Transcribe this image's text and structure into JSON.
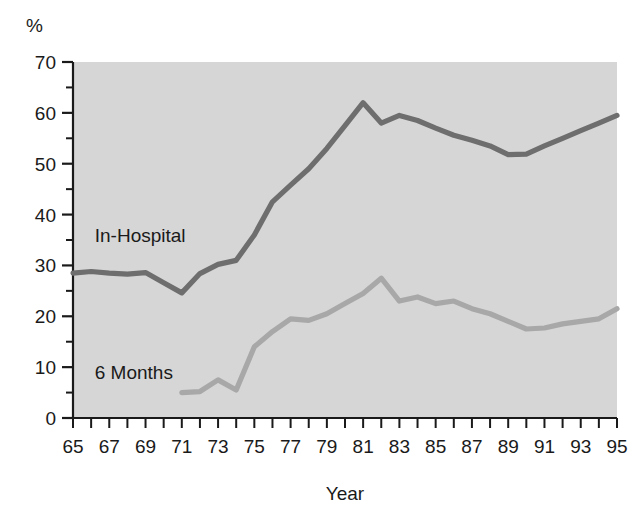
{
  "chart_data": {
    "type": "line",
    "title": "",
    "subtitle": "",
    "xlabel": "Year",
    "ylabel": "%",
    "unit_label": "%",
    "xlim": [
      1965,
      1995
    ],
    "ylim": [
      0,
      70
    ],
    "grid": false,
    "legend_position": "inline-labels",
    "y_major_ticks": [
      0,
      10,
      20,
      30,
      40,
      50,
      60,
      70
    ],
    "y_major_tick_labels": [
      "0",
      "10",
      "20",
      "30",
      "40",
      "50",
      "60",
      "70"
    ],
    "y_minor_ticks": [
      5,
      15,
      25,
      35,
      45,
      55,
      65
    ],
    "x_ticks": [
      1965,
      1966,
      1967,
      1968,
      1969,
      1970,
      1971,
      1972,
      1973,
      1974,
      1975,
      1976,
      1977,
      1978,
      1979,
      1980,
      1981,
      1982,
      1983,
      1984,
      1985,
      1986,
      1987,
      1988,
      1989,
      1990,
      1991,
      1992,
      1993,
      1994,
      1995
    ],
    "x_tick_labels": [
      "65",
      "",
      "67",
      "",
      "69",
      "",
      "71",
      "",
      "73",
      "",
      "75",
      "",
      "77",
      "",
      "79",
      "",
      "81",
      "",
      "83",
      "",
      "85",
      "",
      "87",
      "",
      "89",
      "",
      "91",
      "",
      "93",
      "",
      "95"
    ],
    "x_labeled_values": [
      1965,
      1967,
      1969,
      1971,
      1973,
      1975,
      1977,
      1979,
      1981,
      1983,
      1985,
      1987,
      1989,
      1991,
      1993,
      1995
    ],
    "plot_bg_color": "#d6d6d6",
    "series": [
      {
        "name": "In-Hospital",
        "label": "In-Hospital",
        "color": "#6e6e6e",
        "label_x": 1966.2,
        "label_y": 34.6,
        "x": [
          1965,
          1966,
          1967,
          1968,
          1969,
          1970,
          1971,
          1972,
          1973,
          1974,
          1975,
          1976,
          1977,
          1978,
          1979,
          1980,
          1981,
          1982,
          1983,
          1984,
          1985,
          1986,
          1987,
          1988,
          1989,
          1990,
          1991,
          1992,
          1993,
          1994,
          1995
        ],
        "values": [
          28.5,
          28.8,
          28.5,
          28.3,
          28.6,
          26.6,
          24.6,
          28.4,
          30.2,
          31.0,
          36.0,
          42.5,
          45.8,
          49.0,
          53.0,
          57.5,
          62.0,
          58.0,
          59.5,
          58.5,
          57.0,
          55.6,
          54.6,
          53.5,
          51.8,
          51.9,
          53.5,
          55.0,
          56.5,
          58.0,
          59.5
        ]
      },
      {
        "name": "6 Months",
        "label": "6 Months",
        "color": "#a8a8a8",
        "label_x": 1966.2,
        "label_y": 7.6,
        "x": [
          1971,
          1972,
          1973,
          1974,
          1975,
          1976,
          1977,
          1978,
          1979,
          1980,
          1981,
          1982,
          1983,
          1984,
          1985,
          1986,
          1987,
          1988,
          1989,
          1990,
          1991,
          1992,
          1993,
          1994,
          1995
        ],
        "values": [
          5.0,
          5.2,
          7.5,
          5.5,
          14.0,
          17.0,
          19.5,
          19.2,
          20.5,
          22.5,
          24.5,
          27.5,
          23.0,
          23.8,
          22.5,
          23.0,
          21.5,
          20.5,
          19.0,
          17.5,
          17.7,
          18.5,
          19.0,
          19.5,
          21.5
        ]
      }
    ]
  },
  "geometry": {
    "plot_left": 73,
    "plot_top": 62,
    "plot_right": 617,
    "plot_bottom": 418
  }
}
